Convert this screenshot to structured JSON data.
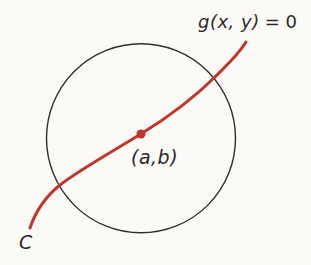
{
  "figure": {
    "equation_label": {
      "function": "g(x, y)",
      "equals": "= 0"
    },
    "point_label": "(a,b)",
    "curve_label": "C"
  },
  "colors": {
    "curve_red": "#c0362e",
    "circle_stroke": "#2f2e2c",
    "background": "#fbfaf7",
    "text": "#2a2927"
  }
}
